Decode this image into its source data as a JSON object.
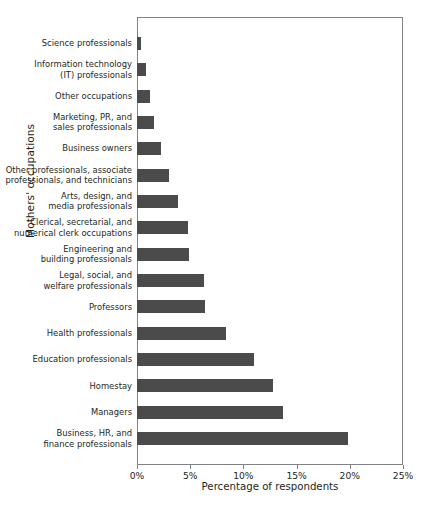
{
  "chart_data": {
    "type": "bar",
    "orientation": "horizontal",
    "title": "",
    "xlabel": "Percentage of respondents",
    "ylabel": "Mothers' occupations",
    "xlim": [
      0,
      25
    ],
    "xticks": [
      0,
      5,
      10,
      15,
      20,
      25
    ],
    "xtick_labels": [
      "0%",
      "5%",
      "10%",
      "15%",
      "20%",
      "25%"
    ],
    "grid": false,
    "legend": null,
    "bar_color": "#4b4b4b",
    "axis_color": "#808285",
    "categories": [
      "Science professionals",
      "Information technology (IT) professionals",
      "Other occupations",
      "Marketing, PR, and sales professionals",
      "Business owners",
      "Other professionals, associate professionals, and technicians",
      "Arts, design, and media professionals",
      "Clerical, secretarial, and numerical clerk occupations",
      "Engineering and building professionals",
      "Legal, social, and welfare professionals",
      "Professors",
      "Health professionals",
      "Education professionals",
      "Homestay",
      "Managers",
      "Business, HR, and finance professionals"
    ],
    "category_lines": [
      [
        "Science professionals"
      ],
      [
        "Information technology",
        "(IT) professionals"
      ],
      [
        "Other occupations"
      ],
      [
        "Marketing, PR, and",
        "sales professionals"
      ],
      [
        "Business owners"
      ],
      [
        "Other professionals, associate",
        "professionals, and technicians"
      ],
      [
        "Arts, design, and",
        "media professionals"
      ],
      [
        "Clerical, secretarial, and",
        "numerical clerk occupations"
      ],
      [
        "Engineering and",
        "building professionals"
      ],
      [
        "Legal, social, and",
        "welfare professionals"
      ],
      [
        "Professors"
      ],
      [
        "Health professionals"
      ],
      [
        "Education professionals"
      ],
      [
        "Homestay"
      ],
      [
        "Managers"
      ],
      [
        "Business, HR, and",
        "finance professionals"
      ]
    ],
    "values": [
      0.4,
      0.8,
      1.2,
      1.6,
      2.3,
      3.0,
      3.9,
      4.8,
      4.9,
      6.3,
      6.4,
      8.4,
      11.0,
      12.8,
      13.7,
      19.8
    ]
  }
}
